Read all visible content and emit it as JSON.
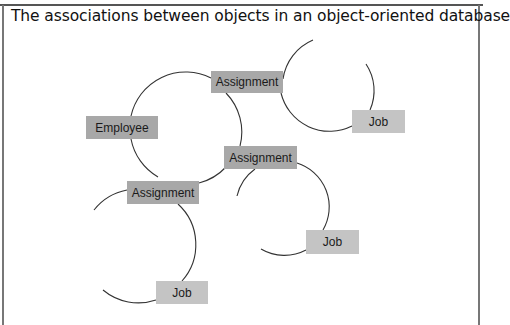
{
  "figure": {
    "title": "The associations between objects in an object-oriented database"
  },
  "colors": {
    "employee_assignment_fill": "#a8a8a8",
    "job_fill": "#c4c4c4",
    "line": "#333333",
    "frame": "#777777"
  },
  "nodes": {
    "employee": {
      "label": "Employee"
    },
    "assignment_top": {
      "label": "Assignment"
    },
    "assignment_middle": {
      "label": "Assignment"
    },
    "assignment_lower_left": {
      "label": "Assignment"
    },
    "job_top": {
      "label": "Job"
    },
    "job_middle": {
      "label": "Job"
    },
    "job_bottom": {
      "label": "Job"
    }
  },
  "associations": [
    {
      "from": "Employee",
      "to": "Assignment"
    },
    {
      "from": "Employee",
      "to": "Assignment"
    },
    {
      "from": "Employee",
      "to": "Assignment"
    },
    {
      "from": "Assignment",
      "to": "Job"
    },
    {
      "from": "Assignment",
      "to": "Job"
    },
    {
      "from": "Assignment",
      "to": "Job"
    }
  ]
}
